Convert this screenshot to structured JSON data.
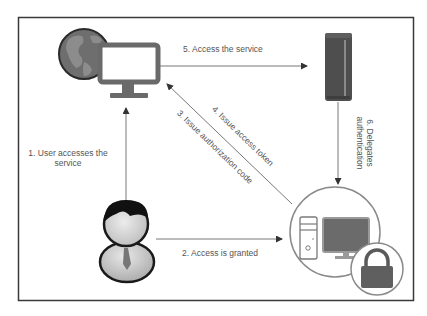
{
  "diagram": {
    "title": "",
    "colors": {
      "frame": "#3a3a3a",
      "arrow": "#555555",
      "icon_dark": "#5a5a5a",
      "icon_mid": "#7a7a7a",
      "icon_light": "#cfcfcf",
      "text": "#555555"
    },
    "nodes": [
      {
        "id": "client",
        "icon": "globe-monitor-icon",
        "label": ""
      },
      {
        "id": "auth-server",
        "icon": "server-tower-icon",
        "label": ""
      },
      {
        "id": "user",
        "icon": "user-icon",
        "label": ""
      },
      {
        "id": "resource",
        "icon": "secure-computer-icon",
        "label": ""
      }
    ],
    "edges": [
      {
        "from": "user",
        "to": "client",
        "label_lines": [
          "1. User accesses the",
          "service"
        ]
      },
      {
        "from": "user",
        "to": "resource",
        "label": "2. Access is granted"
      },
      {
        "from": "resource",
        "to": "client",
        "label": "3. Issue authorization code"
      },
      {
        "from": "resource",
        "to": "client",
        "label": "4. Issue access token"
      },
      {
        "from": "client",
        "to": "auth-server",
        "label": "5. Access the service"
      },
      {
        "from": "auth-server",
        "to": "resource",
        "label_lines": [
          "6. Delegates",
          "authentication"
        ]
      }
    ]
  }
}
